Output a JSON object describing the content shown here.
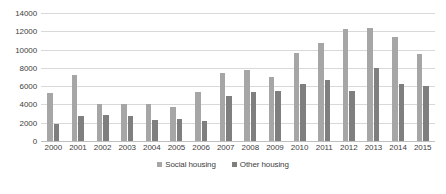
{
  "chart_data": {
    "type": "bar",
    "title": "",
    "xlabel": "",
    "ylabel": "",
    "ylim": [
      0,
      14000
    ],
    "ytick_step": 2000,
    "yticks": [
      "0",
      "2000",
      "4000",
      "6000",
      "8000",
      "10000",
      "12000",
      "14000"
    ],
    "grid": true,
    "legend_position": "bottom",
    "categories": [
      "2000",
      "2001",
      "2002",
      "2003",
      "2004",
      "2005",
      "2006",
      "2007",
      "2008",
      "2009",
      "2010",
      "2011",
      "2012",
      "2013",
      "2014",
      "2015"
    ],
    "series": [
      {
        "name": "Social housing",
        "color": "#a6a6a6",
        "values": [
          5200,
          7200,
          4000,
          4100,
          4000,
          3700,
          5400,
          7400,
          7800,
          7000,
          9600,
          10700,
          12200,
          12400,
          11400,
          9500
        ]
      },
      {
        "name": "Other housing",
        "color": "#7f7f7f",
        "values": [
          1900,
          2700,
          2800,
          2700,
          2300,
          2400,
          2200,
          4900,
          5400,
          5500,
          6200,
          6700,
          5500,
          8000,
          6200,
          6000
        ]
      }
    ]
  },
  "legend": {
    "items": [
      {
        "label": "Social housing",
        "color": "#a6a6a6"
      },
      {
        "label": "Other housing",
        "color": "#7f7f7f"
      }
    ]
  }
}
